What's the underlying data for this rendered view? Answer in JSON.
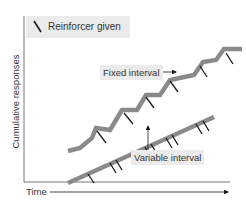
{
  "chart_data": {
    "type": "line",
    "title": "",
    "xlabel": "Time",
    "ylabel": "Cumulative responses",
    "legend": [
      {
        "symbol": "tick-mark",
        "label": "Reinforcer given"
      }
    ],
    "series": [
      {
        "name": "Fixed interval",
        "style": "scalloped",
        "color": "#8a8a8a",
        "points": [
          [
            68,
            151
          ],
          [
            80,
            148
          ],
          [
            92,
            138
          ],
          [
            96,
            128
          ],
          [
            110,
            130
          ],
          [
            122,
            110
          ],
          [
            137,
            110
          ],
          [
            146,
            95
          ],
          [
            160,
            95
          ],
          [
            170,
            80
          ],
          [
            194,
            75
          ],
          [
            203,
            62
          ],
          [
            216,
            60
          ],
          [
            224,
            49
          ],
          [
            242,
            49
          ]
        ],
        "reinforcer_ticks": [
          [
            97,
            131,
            106,
            143
          ],
          [
            124,
            113,
            133,
            124
          ],
          [
            146,
            97,
            154,
            108
          ],
          [
            170,
            81,
            178,
            92
          ],
          [
            200,
            66,
            207,
            77
          ],
          [
            226,
            53,
            233,
            64
          ]
        ]
      },
      {
        "name": "Variable interval",
        "style": "steady-linear",
        "color": "#8a8a8a",
        "points": [
          [
            68,
            183
          ],
          [
            214,
            117
          ]
        ],
        "reinforcer_ticks": [
          [
            88,
            174,
            94,
            183
          ],
          [
            110,
            163,
            116,
            173
          ],
          [
            116,
            160,
            122,
            170
          ],
          [
            145,
            147,
            151,
            157
          ],
          [
            151,
            144,
            157,
            154
          ],
          [
            166,
            138,
            172,
            148
          ],
          [
            172,
            135,
            178,
            145
          ],
          [
            196,
            124,
            202,
            134
          ],
          [
            203,
            121,
            209,
            131
          ]
        ]
      }
    ],
    "annotations": [
      "Fixed interval",
      "Variable interval"
    ],
    "grid": false
  },
  "labels": {
    "legend": "Reinforcer given",
    "y_axis": "Cumulative responses",
    "x_axis": "Time",
    "fixed": "Fixed interval",
    "variable": "Variable interval"
  },
  "colors": {
    "line": "#8a8a8a",
    "tick": "#1a1a1a",
    "axis": "#555555",
    "label_bg": "#ebebeb"
  }
}
